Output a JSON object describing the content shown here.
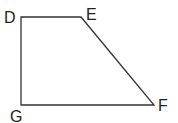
{
  "figure": {
    "type": "trapezoid",
    "stroke_color": "#333333",
    "vertices": [
      {
        "label": "D",
        "x": 21,
        "y": 17
      },
      {
        "label": "E",
        "x": 81,
        "y": 17
      },
      {
        "label": "F",
        "x": 154,
        "y": 105
      },
      {
        "label": "G",
        "x": 21,
        "y": 105
      }
    ]
  }
}
